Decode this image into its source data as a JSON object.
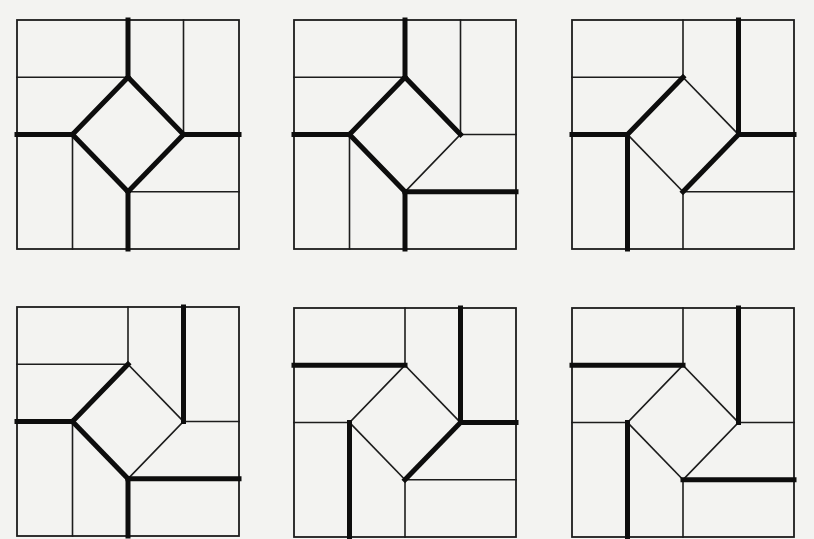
{
  "figure": {
    "grid_units": 4,
    "colors": {
      "background": "#f3f3f1",
      "line": "#1c1c1c",
      "bold_line": "#0d0d0d"
    },
    "segment_definitions": {
      "top_vertical": [
        2,
        0,
        2,
        1
      ],
      "top_left_band": [
        0,
        1,
        2,
        1
      ],
      "right_top_vertical": [
        3,
        0,
        3,
        2
      ],
      "right_horizontal": [
        3,
        2,
        4,
        2
      ],
      "left_horizontal": [
        0,
        2,
        1,
        2
      ],
      "left_bottom_vertical": [
        1,
        2,
        1,
        4
      ],
      "bottom_vertical": [
        2,
        3,
        2,
        4
      ],
      "bottom_right_band": [
        2,
        3,
        4,
        3
      ],
      "diamond_tl": [
        1,
        2,
        2,
        1
      ],
      "diamond_tr": [
        2,
        1,
        3,
        2
      ],
      "diamond_br": [
        3,
        2,
        2,
        3
      ],
      "diamond_bl": [
        2,
        3,
        1,
        2
      ]
    },
    "panels": [
      {
        "id": "panel-1",
        "position": {
          "left": 17,
          "top": 20
        },
        "bold": [
          "top_vertical",
          "diamond_tl",
          "diamond_tr",
          "diamond_br",
          "diamond_bl",
          "left_horizontal",
          "right_horizontal",
          "bottom_vertical"
        ]
      },
      {
        "id": "panel-2",
        "position": {
          "left": 294,
          "top": 20
        },
        "bold": [
          "top_vertical",
          "diamond_tl",
          "diamond_tr",
          "diamond_bl",
          "left_horizontal",
          "bottom_vertical",
          "bottom_right_band"
        ]
      },
      {
        "id": "panel-3",
        "position": {
          "left": 572,
          "top": 20
        },
        "bold": [
          "diamond_tl",
          "diamond_br",
          "left_horizontal",
          "right_horizontal",
          "right_top_vertical",
          "left_bottom_vertical"
        ]
      },
      {
        "id": "panel-4",
        "position": {
          "left": 17,
          "top": 307
        },
        "bold": [
          "diamond_tl",
          "diamond_bl",
          "left_horizontal",
          "right_top_vertical",
          "bottom_vertical",
          "bottom_right_band"
        ]
      },
      {
        "id": "panel-5",
        "position": {
          "left": 294,
          "top": 308
        },
        "bold": [
          "top_left_band",
          "right_top_vertical",
          "right_horizontal",
          "diamond_br",
          "left_bottom_vertical"
        ]
      },
      {
        "id": "panel-6",
        "position": {
          "left": 572,
          "top": 308
        },
        "bold": [
          "top_left_band",
          "right_top_vertical",
          "left_bottom_vertical",
          "bottom_right_band"
        ]
      }
    ]
  }
}
